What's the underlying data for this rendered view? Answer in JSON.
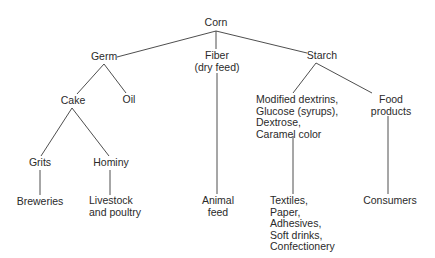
{
  "diagram": {
    "type": "tree",
    "root": "Corn",
    "nodes": {
      "corn": "Corn",
      "germ": "Germ",
      "fiber_1": "Fiber",
      "fiber_2": "(dry feed)",
      "starch": "Starch",
      "cake": "Cake",
      "oil": "Oil",
      "grits": "Grits",
      "hominy": "Hominy",
      "breweries": "Breweries",
      "livestock_1": "Livestock",
      "livestock_2": "and poultry",
      "animal_feed_1": "Animal",
      "animal_feed_2": "feed",
      "modified_1": "Modified dextrins,",
      "modified_2": "Glucose (syrups),",
      "modified_3": "Dextrose,",
      "modified_4": "Caramel color",
      "food_1": "Food",
      "food_2": "products",
      "textiles_1": "Textiles,",
      "textiles_2": "Paper,",
      "textiles_3": "Adhesives,",
      "textiles_4": "Soft drinks,",
      "textiles_5": "Confectionery",
      "consumers": "Consumers"
    },
    "edges": [
      [
        "Corn",
        "Germ"
      ],
      [
        "Corn",
        "Fiber (dry feed)"
      ],
      [
        "Corn",
        "Starch"
      ],
      [
        "Germ",
        "Cake"
      ],
      [
        "Germ",
        "Oil"
      ],
      [
        "Cake",
        "Grits"
      ],
      [
        "Cake",
        "Hominy"
      ],
      [
        "Grits",
        "Breweries"
      ],
      [
        "Hominy",
        "Livestock and poultry"
      ],
      [
        "Fiber (dry feed)",
        "Animal feed"
      ],
      [
        "Starch",
        "Modified dextrins, Glucose (syrups), Dextrose, Caramel color"
      ],
      [
        "Starch",
        "Food products"
      ],
      [
        "Modified dextrins, Glucose (syrups), Dextrose, Caramel color",
        "Textiles, Paper, Adhesives, Soft drinks, Confectionery"
      ],
      [
        "Food products",
        "Consumers"
      ]
    ]
  }
}
